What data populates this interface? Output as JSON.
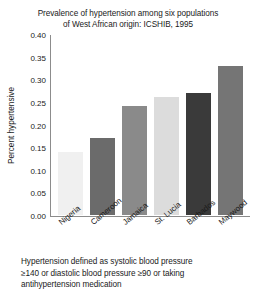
{
  "chart_data": {
    "type": "bar",
    "title": "Prevalence of hypertension among six populations of West African origin: ICSHIB, 1995",
    "title_lines": [
      "Prevalence of hypertension among six populations",
      "of West African origin: ICSHIB, 1995"
    ],
    "xlabel": "",
    "ylabel": "Percent hypertensive",
    "categories": [
      "Nigeria",
      "Cameroon",
      "Jamaica",
      "St. Lucia",
      "Barbados",
      "Maywood"
    ],
    "values": [
      0.14,
      0.17,
      0.24,
      0.26,
      0.27,
      0.33
    ],
    "bar_colors": [
      "#f0f0f0",
      "#6b6b6b",
      "#8a8a8a",
      "#dcdcdc",
      "#3a3a3a",
      "#757575"
    ],
    "ylim": [
      0.0,
      0.4
    ],
    "ytick_labels": [
      "0.40",
      "0.35",
      "0.30",
      "0.25",
      "0.20",
      "0.15",
      "0.10",
      "0.05",
      "0.00"
    ],
    "ytick_values": [
      0.4,
      0.35,
      0.3,
      0.25,
      0.2,
      0.15,
      0.1,
      0.05,
      0.0
    ],
    "grid": false,
    "legend": null,
    "axis_color": "#8c8c8c"
  },
  "caption": {
    "lines": [
      "Hypertension defined as systolic blood pressure",
      "≥140 or diastolic blood pressure ≥90 or taking",
      "antihypertension medication"
    ],
    "text": "Hypertension defined as systolic blood pressure ≥140 or diastolic blood pressure ≥90 or taking antihypertension medication"
  }
}
